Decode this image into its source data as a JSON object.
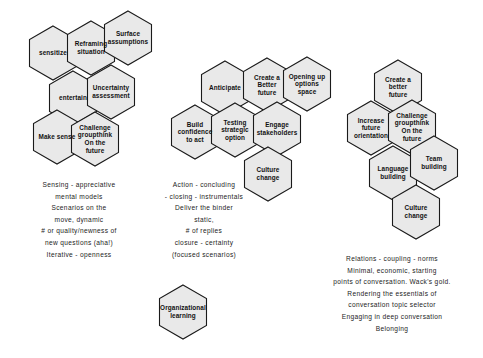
{
  "diagram": {
    "style": {
      "hex_fill": "#e9e9e9",
      "hex_stroke": "#1a1a1a",
      "background": "#ffffff",
      "text_color": "#1a1a1a"
    },
    "clusters": [
      {
        "id": "sensing",
        "name": "sensing-cluster",
        "hexes": [
          {
            "id": "sensitize",
            "label": "sensitize",
            "cx": 53,
            "cy": 53
          },
          {
            "id": "reframing-situation",
            "label": "Reframing\nsituation",
            "cx": 91,
            "cy": 48
          },
          {
            "id": "surface-assumptions",
            "label": "Surface\nassumptions",
            "cx": 128,
            "cy": 38
          },
          {
            "id": "entertain",
            "label": "entertain",
            "cx": 73,
            "cy": 98
          },
          {
            "id": "uncertainty-assessment",
            "label": "Uncertainty\nassessment",
            "cx": 111,
            "cy": 92
          },
          {
            "id": "make-sense",
            "label": "Make sense",
            "cx": 57,
            "cy": 137
          },
          {
            "id": "challenge-groupthink-on-the-future",
            "label": "Challenge\ngroupthink\nOn the\nfuture",
            "cx": 95,
            "cy": 139
          }
        ],
        "caption": [
          "Sensing - appreciative",
          "mental models",
          "Scenarios on the",
          "move, dynamic",
          "# or quality/newness of",
          "new questions (aha!)",
          "Iterative - openness"
        ],
        "caption_x": 14,
        "caption_y": 179,
        "caption_w": 130
      },
      {
        "id": "action",
        "name": "action-cluster",
        "hexes": [
          {
            "id": "anticipate",
            "label": "Anticipate",
            "cx": 225,
            "cy": 88
          },
          {
            "id": "create-a-better-future-mid",
            "label": "Create a\nBetter\nfuture",
            "cx": 267,
            "cy": 85
          },
          {
            "id": "opening-up-options-space",
            "label": "Opening up\noptions\nspace",
            "cx": 307,
            "cy": 84
          },
          {
            "id": "build-confidence-to-act",
            "label": "Build\nconfidence\nto act",
            "cx": 195,
            "cy": 132
          },
          {
            "id": "testing-strategic-option",
            "label": "Testing\nstrategic\noption",
            "cx": 235,
            "cy": 130
          },
          {
            "id": "engage-stakeholders",
            "label": "Engage\nstakeholders",
            "cx": 277,
            "cy": 129
          },
          {
            "id": "culture-change-mid",
            "label": "Culture\nchange",
            "cx": 268,
            "cy": 174
          }
        ],
        "caption": [
          "Action - concluding",
          "- closing - instrumentals",
          "Deliver the binder",
          "static,",
          "# of replies",
          "closure - certainty",
          "(focused scenarios)"
        ],
        "caption_x": 140,
        "caption_y": 179,
        "caption_w": 128
      },
      {
        "id": "relations",
        "name": "relations-cluster",
        "hexes": [
          {
            "id": "create-a-better-future-right",
            "label": "Create a\nbetter\nfuture",
            "cx": 398,
            "cy": 87
          },
          {
            "id": "increase-future-orientation",
            "label": "Increase\nfuture\norientation",
            "cx": 371,
            "cy": 128
          },
          {
            "id": "challenge-groupthink-on-the-future-right",
            "label": "Challenge\ngroupthink\nOn the\nfuture",
            "cx": 412,
            "cy": 127
          },
          {
            "id": "language-building",
            "label": "Language\nbuilding",
            "cx": 393,
            "cy": 173
          },
          {
            "id": "team-building",
            "label": "Team\nbuilding",
            "cx": 434,
            "cy": 163
          },
          {
            "id": "culture-change-right",
            "label": "Culture\nchange",
            "cx": 416,
            "cy": 212
          }
        ],
        "caption": [
          "Relations - coupling - norms",
          "Minimal, economic, starting",
          "points of conversation. Wack's gold.",
          "Rendering the essentials of",
          "conversation topic selector",
          "Engaging in deep conversation",
          "Belonging"
        ],
        "caption_x": 307,
        "caption_y": 253,
        "caption_w": 170
      }
    ],
    "standalone_hexes": [
      {
        "id": "organizational-learning",
        "label": "Organizational\nlearning",
        "cx": 183,
        "cy": 312
      }
    ]
  }
}
